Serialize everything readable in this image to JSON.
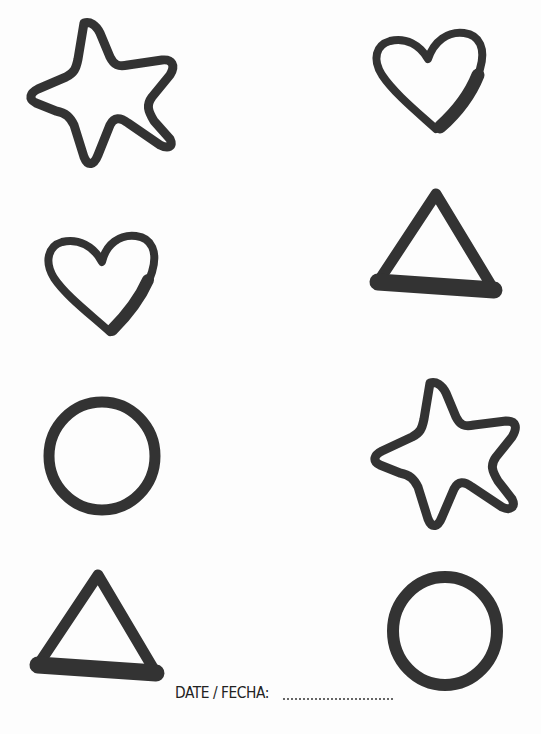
{
  "worksheet": {
    "type": "shape-matching",
    "ink_color": "#333333",
    "background_color": "#ffffff",
    "left_column": [
      {
        "shape": "star",
        "label": "star"
      },
      {
        "shape": "heart",
        "label": "heart"
      },
      {
        "shape": "circle",
        "label": "circle"
      },
      {
        "shape": "triangle",
        "label": "triangle"
      }
    ],
    "right_column": [
      {
        "shape": "heart",
        "label": "heart"
      },
      {
        "shape": "triangle",
        "label": "triangle"
      },
      {
        "shape": "star",
        "label": "star"
      },
      {
        "shape": "circle",
        "label": "circle"
      }
    ]
  },
  "footer": {
    "date_label": "DATE / FECHA:",
    "date_value": ""
  }
}
